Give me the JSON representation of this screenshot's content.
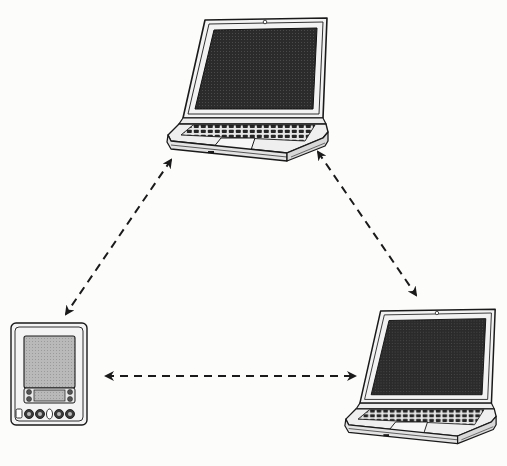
{
  "diagram": {
    "type": "network-topology",
    "layout": "triangle",
    "background": "#fcfcfb",
    "ink_color": "#1a1a1a",
    "screen_color": "#2b2b2b",
    "nodes": [
      {
        "id": "laptop-top",
        "kind": "laptop",
        "icon": "laptop-icon",
        "x": 165,
        "y": 14,
        "w": 165,
        "h": 148
      },
      {
        "id": "pda",
        "kind": "pda",
        "icon": "pda-icon",
        "x": 10,
        "y": 322,
        "w": 78,
        "h": 104
      },
      {
        "id": "laptop-bottom-right",
        "kind": "laptop",
        "icon": "laptop-icon",
        "x": 343,
        "y": 300,
        "w": 155,
        "h": 150
      }
    ],
    "edges": [
      {
        "from": "laptop-top",
        "to": "pda",
        "style": "dashed",
        "arrows": "both",
        "x1": 171,
        "y1": 160,
        "x2": 66,
        "y2": 314
      },
      {
        "from": "laptop-top",
        "to": "laptop-bottom-right",
        "style": "dashed",
        "arrows": "both",
        "x1": 318,
        "y1": 152,
        "x2": 416,
        "y2": 295
      },
      {
        "from": "pda",
        "to": "laptop-bottom-right",
        "style": "dashed",
        "arrows": "both",
        "x1": 106,
        "y1": 376,
        "x2": 355,
        "y2": 376
      }
    ],
    "labels": []
  }
}
